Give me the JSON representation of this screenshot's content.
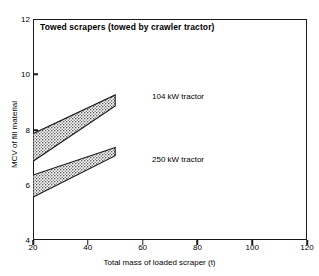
{
  "chart_data": {
    "type": "area",
    "title": "Towed scrapers  (towed by crawler tractor)",
    "xlabel": "Total mass of loaded scraper (t)",
    "ylabel": "MCV of fill material",
    "xlim": [
      20,
      120
    ],
    "ylim": [
      4,
      12
    ],
    "xticks": [
      20,
      40,
      60,
      80,
      100,
      120
    ],
    "yticks": [
      4,
      6,
      8,
      10,
      12
    ],
    "grid": false,
    "legend_position": "inline-annotation",
    "series": [
      {
        "name": "104 kW tractor",
        "label": "104 kW tractor",
        "x": [
          20,
          50
        ],
        "upper": [
          7.85,
          9.25
        ],
        "lower": [
          6.85,
          8.85
        ],
        "fill": "stipple"
      },
      {
        "name": "250 kW tractor",
        "label": "250 kW tractor",
        "x": [
          20,
          50
        ],
        "upper": [
          6.35,
          7.35
        ],
        "lower": [
          5.55,
          7.05
        ],
        "fill": "stipple"
      }
    ]
  },
  "axes": {
    "y_tick_labels": [
      "12",
      "10",
      "8",
      "6",
      "4"
    ],
    "x_tick_labels": [
      "20",
      "40",
      "60",
      "80",
      "100",
      "120"
    ],
    "y_title": "MCV of fill material",
    "x_title": "Total mass of loaded scraper (t)"
  },
  "annotations": {
    "title": "Towed scrapers  (towed by crawler tractor)",
    "series_104": "104 kW tractor",
    "series_250": "250 kW tractor"
  },
  "colors": {
    "axis": "#1a1a1a",
    "band_outline": "#1a1a1a",
    "band_fill": "#b9b9b9",
    "background": "#ffffff"
  }
}
